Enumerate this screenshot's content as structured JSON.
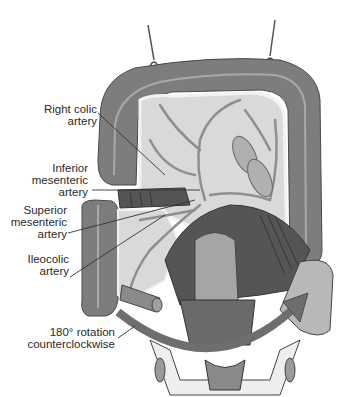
{
  "figure": {
    "type": "anatomical-illustration",
    "colors": {
      "colon": "#7d7d7d",
      "colon_haustra_line": "#a9a9a9",
      "mesentery": "#d9d9d9",
      "mesentery_edge": "#f2f2f2",
      "vessels": "#8f8f8f",
      "muscle_dark": "#555555",
      "rotation_arrow": "#6e6e6e",
      "leader_line": "#333333",
      "text": "#2a2a2a"
    }
  },
  "labels": [
    {
      "id": "right-colic-artery",
      "lines": [
        "Right colic",
        "artery"
      ]
    },
    {
      "id": "inferior-mesenteric-artery",
      "lines": [
        "Inferior",
        "mesenteric",
        "artery"
      ]
    },
    {
      "id": "superior-mesenteric-artery",
      "lines": [
        "Superior",
        "mesenteric",
        "artery"
      ]
    },
    {
      "id": "ileocolic-artery",
      "lines": [
        "Ileocolic",
        "artery"
      ]
    },
    {
      "id": "rotation",
      "lines": [
        "180° rotation",
        "counterclockwise"
      ]
    }
  ]
}
